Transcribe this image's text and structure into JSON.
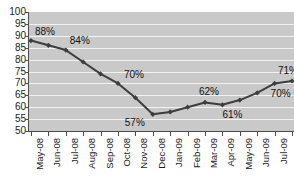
{
  "chart_data": {
    "type": "line",
    "title": "",
    "xlabel": "",
    "ylabel": "",
    "ylim": [
      50,
      100
    ],
    "ytick_step": 5,
    "grid": true,
    "legend": "none",
    "series_color": "#3d3d3d",
    "plot_background": "#c9c9c9",
    "gridline_color": "#f2f2f2",
    "categories": [
      "May-08",
      "Jun-08",
      "Jul-08",
      "Aug-08",
      "Sep-08",
      "Oct-08",
      "Nov-08",
      "Dec-08",
      "Jan-09",
      "Feb-09",
      "Mar-09",
      "Apr-09",
      "May-09",
      "Jun-09",
      "Jul-09",
      "Aug-09"
    ],
    "values": [
      88,
      86,
      84,
      79,
      74,
      70,
      64,
      57,
      58,
      60,
      62,
      61,
      63,
      66,
      70,
      71
    ],
    "ytick_labels": [
      "100",
      "95",
      "90",
      "85",
      "80",
      "75",
      "70",
      "65",
      "60",
      "55",
      "50"
    ],
    "point_labels": [
      {
        "index": 0,
        "text": "88%"
      },
      {
        "index": 2,
        "text": "84%"
      },
      {
        "index": 5,
        "text": "70%"
      },
      {
        "index": 7,
        "text": "57%"
      },
      {
        "index": 10,
        "text": "62%"
      },
      {
        "index": 11,
        "text": "61%"
      },
      {
        "index": 14,
        "text": "70%"
      },
      {
        "index": 15,
        "text": "71%"
      }
    ]
  }
}
